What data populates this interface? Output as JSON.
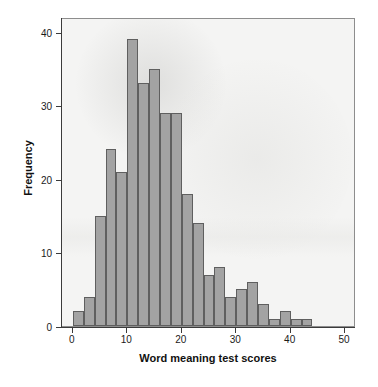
{
  "chart_data": {
    "type": "bar",
    "title": "",
    "subtitle": "",
    "xlabel": "Word meaning test scores",
    "ylabel": "Frequency",
    "xlim": [
      -2,
      52
    ],
    "ylim": [
      0,
      42
    ],
    "grid": false,
    "legend": null,
    "bin_width": 2,
    "bar_color": "#a3a3a3",
    "bar_edge_color": "#5f5f5f",
    "plot_background": "#f4f4f3",
    "x_ticks": [
      0,
      10,
      20,
      30,
      40,
      50
    ],
    "x_tick_labels": [
      "0",
      "10",
      "20",
      "30",
      "40",
      "50"
    ],
    "y_ticks": [
      0,
      10,
      20,
      30,
      40
    ],
    "y_tick_labels": [
      "0",
      "10",
      "20",
      "30",
      "40"
    ],
    "categories": [
      "0-2",
      "2-4",
      "4-6",
      "6-8",
      "8-10",
      "10-12",
      "12-14",
      "14-16",
      "16-18",
      "18-20",
      "20-22",
      "22-24",
      "24-26",
      "26-28",
      "28-30",
      "30-32",
      "32-34",
      "34-36",
      "36-38",
      "38-40",
      "40-42",
      "42-44"
    ],
    "bin_starts": [
      0,
      2,
      4,
      6,
      8,
      10,
      12,
      14,
      16,
      18,
      20,
      22,
      24,
      26,
      28,
      30,
      32,
      34,
      36,
      38,
      40,
      42
    ],
    "values": [
      2,
      4,
      15,
      24,
      21,
      39,
      33,
      35,
      29,
      29,
      18,
      14,
      7,
      8,
      4,
      5,
      6,
      3,
      1,
      2,
      1,
      1
    ]
  }
}
